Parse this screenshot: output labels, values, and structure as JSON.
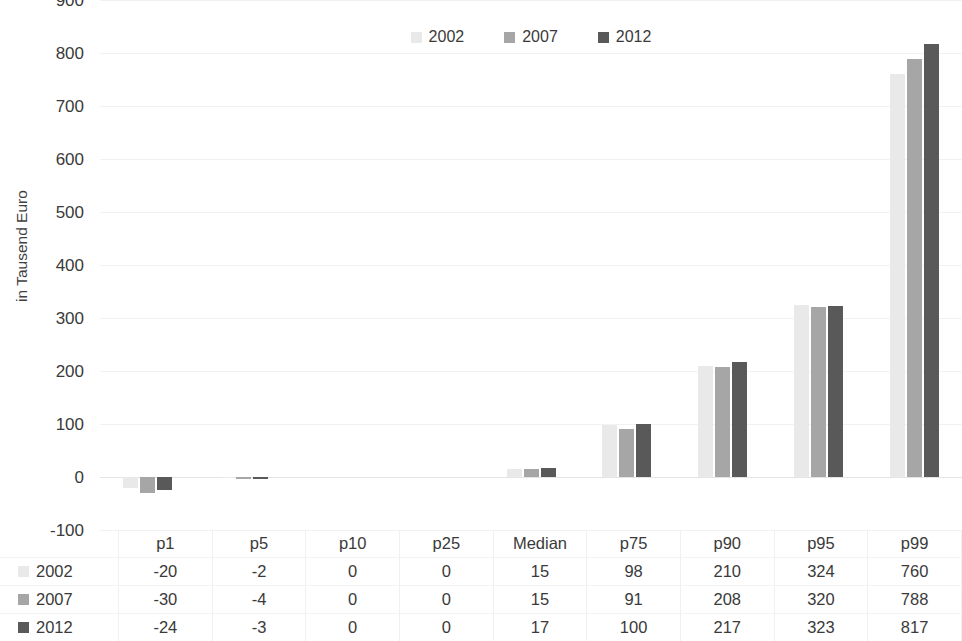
{
  "chart": {
    "type": "bar",
    "y_axis_title": "in Tausend Euro",
    "y_ticks": [
      "900",
      "800",
      "700",
      "600",
      "500",
      "400",
      "300",
      "200",
      "100",
      "0",
      "-100"
    ]
  },
  "legend": {
    "items": [
      {
        "label": "2002",
        "color": "#e9e9e9"
      },
      {
        "label": "2007",
        "color": "#a6a6a6"
      },
      {
        "label": "2012",
        "color": "#595959"
      }
    ]
  },
  "table": {
    "corner": "",
    "columns": [
      "p1",
      "p5",
      "p10",
      "p25",
      "Median",
      "p75",
      "p90",
      "p95",
      "p99"
    ],
    "rows": [
      {
        "label": "2002",
        "color": "#e9e9e9",
        "values": [
          "-20",
          "-2",
          "0",
          "0",
          "15",
          "98",
          "210",
          "324",
          "760"
        ]
      },
      {
        "label": "2007",
        "color": "#a6a6a6",
        "values": [
          "-30",
          "-4",
          "0",
          "0",
          "15",
          "91",
          "208",
          "320",
          "788"
        ]
      },
      {
        "label": "2012",
        "color": "#595959",
        "values": [
          "-24",
          "-3",
          "0",
          "0",
          "17",
          "100",
          "217",
          "323",
          "817"
        ]
      }
    ]
  },
  "chart_data": {
    "type": "bar",
    "title": "",
    "subtitle": "",
    "xlabel": "",
    "ylabel": "in Tausend Euro",
    "ylim": [
      -100,
      900
    ],
    "ytick_step": 100,
    "grid": true,
    "legend_position": "top-center",
    "categories": [
      "p1",
      "p5",
      "p10",
      "p25",
      "Median",
      "p75",
      "p90",
      "p95",
      "p99"
    ],
    "series": [
      {
        "name": "2002",
        "color": "#e9e9e9",
        "values": [
          -20,
          -2,
          0,
          0,
          15,
          98,
          210,
          324,
          760
        ]
      },
      {
        "name": "2007",
        "color": "#a6a6a6",
        "values": [
          -30,
          -4,
          0,
          0,
          15,
          91,
          208,
          320,
          788
        ]
      },
      {
        "name": "2012",
        "color": "#595959",
        "values": [
          -24,
          -3,
          0,
          0,
          17,
          100,
          217,
          323,
          817
        ]
      }
    ]
  }
}
